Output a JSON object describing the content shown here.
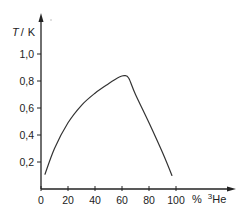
{
  "chart_data": {
    "type": "line",
    "title": "",
    "xlabel": "% ³He",
    "ylabel": "T / K",
    "xlim": [
      0,
      100
    ],
    "ylim": [
      0,
      1.0
    ],
    "x_ticks": [
      "0",
      "20",
      "40",
      "60",
      "80",
      "100"
    ],
    "y_ticks": [
      "0,2",
      "0,4",
      "0,6",
      "0,8",
      "1,0"
    ],
    "grid": false,
    "legend": null,
    "series": [
      {
        "name": "phase separation curve",
        "x": [
          3,
          10,
          20,
          30,
          40,
          50,
          58,
          62,
          65,
          70,
          80,
          90,
          97
        ],
        "y": [
          0.11,
          0.3,
          0.49,
          0.62,
          0.71,
          0.78,
          0.83,
          0.84,
          0.82,
          0.7,
          0.49,
          0.27,
          0.1
        ]
      }
    ]
  },
  "axis": {
    "y_label_T": "T",
    "y_label_sep": "/",
    "y_label_unit": "K",
    "x_label_pct": "%",
    "x_label_sup": "3",
    "x_label_el": "He"
  },
  "colors": {
    "line": "#333333",
    "axis": "#222222"
  }
}
